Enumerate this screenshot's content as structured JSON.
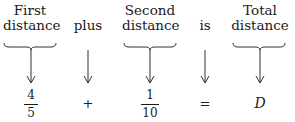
{
  "columns": [
    {
      "label_lines": [
        "First",
        "distance"
      ],
      "braced": true,
      "expr": {
        "type": "fraction",
        "numerator": "4",
        "denominator": "5"
      }
    },
    {
      "label_lines": [
        "plus"
      ],
      "braced": false,
      "expr": {
        "type": "symbol",
        "value": "+"
      }
    },
    {
      "label_lines": [
        "Second",
        "distance"
      ],
      "braced": true,
      "expr": {
        "type": "fraction",
        "numerator": "1",
        "denominator": "10"
      }
    },
    {
      "label_lines": [
        "is"
      ],
      "braced": false,
      "expr": {
        "type": "symbol",
        "value": "="
      }
    },
    {
      "label_lines": [
        "Total",
        "distance"
      ],
      "braced": true,
      "expr": {
        "type": "variable",
        "value": "D"
      }
    }
  ],
  "equation": "4/5 + 1/10 = D",
  "colors": {
    "ink": "#1a1a1a",
    "background": "#ffffff"
  }
}
